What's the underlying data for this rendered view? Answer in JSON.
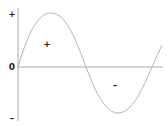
{
  "diagram": {
    "type": "sine-wave",
    "axis_labels": {
      "top": "+",
      "origin": "0",
      "bottom": "–"
    },
    "region_labels": {
      "positive": "+",
      "negative": "–"
    },
    "colors": {
      "curve": "#b5b5b5",
      "axis": "#aaaaaa",
      "text": "#222222"
    }
  }
}
